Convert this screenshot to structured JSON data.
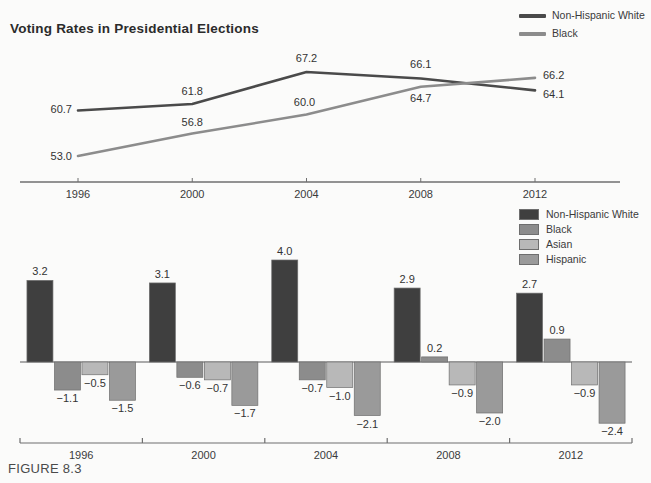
{
  "figure": {
    "caption": "FIGURE 8.3",
    "title": "Voting Rates in Presidential Elections"
  },
  "colors": {
    "non_hispanic_white": "#4a4a4a",
    "black": "#8c8c8c",
    "asian": "#b8b8b8",
    "hispanic": "#9a9a9a",
    "bar_white": "#3f3f3f",
    "axis": "#6f6f6f",
    "text": "#3a3a3a",
    "background": "#fbfbfa"
  },
  "line_legend": {
    "items": [
      {
        "label": "Non-Hispanic White",
        "color": "#4a4a4a"
      },
      {
        "label": "Black",
        "color": "#8c8c8c"
      }
    ]
  },
  "bar_legend": {
    "items": [
      {
        "label": "Non-Hispanic White",
        "color": "#3f3f3f"
      },
      {
        "label": "Black",
        "color": "#8c8c8c"
      },
      {
        "label": "Asian",
        "color": "#b8b8b8"
      },
      {
        "label": "Hispanic",
        "color": "#9a9a9a"
      }
    ]
  },
  "chart_data": [
    {
      "type": "line",
      "title": "Voting Rates in Presidential Elections",
      "xlabel": "",
      "ylabel": "",
      "categories": [
        "1996",
        "2000",
        "2004",
        "2008",
        "2012"
      ],
      "x": [
        1996,
        2000,
        2004,
        2008,
        2012
      ],
      "ylim": [
        50,
        69
      ],
      "grid": false,
      "legend_position": "top-right",
      "series": [
        {
          "name": "Non-Hispanic White",
          "color": "#4a4a4a",
          "values": [
            60.7,
            61.8,
            67.2,
            66.1,
            64.1
          ],
          "labels": [
            "60.7",
            "61.8",
            "67.2",
            "66.1",
            "64.1"
          ]
        },
        {
          "name": "Black",
          "color": "#8c8c8c",
          "values": [
            53.0,
            56.8,
            60.0,
            64.7,
            66.2
          ],
          "labels": [
            "53.0",
            "56.8",
            "60.0",
            "64.7",
            "66.2"
          ]
        }
      ]
    },
    {
      "type": "bar",
      "title": "",
      "xlabel": "",
      "ylabel": "",
      "categories": [
        "1996",
        "2000",
        "2004",
        "2008",
        "2012"
      ],
      "ylim": [
        -2.8,
        4.4
      ],
      "grid": false,
      "legend_position": "top-right",
      "series": [
        {
          "name": "Non-Hispanic White",
          "color": "#3f3f3f",
          "values": [
            3.2,
            3.1,
            4.0,
            2.9,
            2.7
          ],
          "labels": [
            "3.2",
            "3.1",
            "4.0",
            "2.9",
            "2.7"
          ]
        },
        {
          "name": "Black",
          "color": "#8c8c8c",
          "values": [
            -1.1,
            -0.6,
            -0.7,
            0.2,
            0.9
          ],
          "labels": [
            "−1.1",
            "−0.6",
            "−0.7",
            "0.2",
            "0.9"
          ]
        },
        {
          "name": "Asian",
          "color": "#b8b8b8",
          "values": [
            -0.5,
            -0.7,
            -1.0,
            -0.9,
            -0.9
          ],
          "labels": [
            "−0.5",
            "−0.7",
            "−1.0",
            "−0.9",
            "−0.9"
          ]
        },
        {
          "name": "Hispanic",
          "color": "#9a9a9a",
          "values": [
            -1.5,
            -1.7,
            -2.1,
            -2.0,
            -2.4
          ],
          "labels": [
            "−1.5",
            "−1.7",
            "−2.1",
            "−2.0",
            "−2.4"
          ]
        }
      ]
    }
  ]
}
